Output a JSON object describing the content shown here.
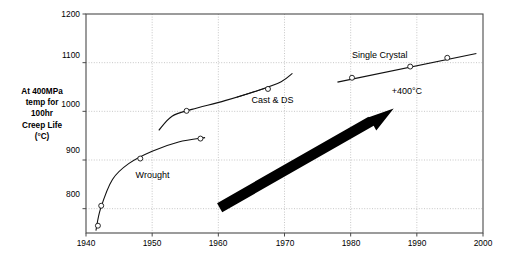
{
  "chart_data": {
    "type": "scatter",
    "title": "",
    "subtitle": "",
    "xlabel": "",
    "ylabel": "At 400MPa\ntemp for\n100hr\nCreep Life\n(°C)",
    "xlim": [
      1940,
      2000
    ],
    "ylim": [
      750,
      1200
    ],
    "xticks": [
      1940,
      1950,
      1960,
      1970,
      1980,
      1990,
      2000
    ],
    "xticklabels": [
      "1940",
      "1950",
      "1960",
      "1970",
      "1980",
      "1990",
      "2000"
    ],
    "yticks": [
      800,
      900,
      1000,
      1100,
      1200
    ],
    "yticklabels": [
      "800",
      "900",
      "1000",
      "1100",
      "1200"
    ],
    "grid": true,
    "legend_position": "inline-annotations",
    "series": [
      {
        "name": "Wrought",
        "label_x": 1947.5,
        "label_y": 868,
        "marker": "open-circle",
        "points": [
          {
            "x": 1941.8,
            "y": 765
          },
          {
            "x": 1942.3,
            "y": 806
          },
          {
            "x": 1948.2,
            "y": 903
          },
          {
            "x": 1957.3,
            "y": 944
          }
        ],
        "curve": [
          {
            "x": 1941.5,
            "y": 755
          },
          {
            "x": 1942.2,
            "y": 800
          },
          {
            "x": 1944.0,
            "y": 860
          },
          {
            "x": 1946.5,
            "y": 893
          },
          {
            "x": 1950.0,
            "y": 918
          },
          {
            "x": 1954.0,
            "y": 937
          },
          {
            "x": 1958.0,
            "y": 946
          }
        ]
      },
      {
        "name": "Cast & DS",
        "label_x": 1965.0,
        "label_y": 1022,
        "marker": "open-circle",
        "points": [
          {
            "x": 1955.2,
            "y": 1001
          },
          {
            "x": 1967.5,
            "y": 1046
          }
        ],
        "curve": [
          {
            "x": 1951.0,
            "y": 961
          },
          {
            "x": 1953.0,
            "y": 990
          },
          {
            "x": 1956.0,
            "y": 1004
          },
          {
            "x": 1961.0,
            "y": 1022
          },
          {
            "x": 1966.0,
            "y": 1043
          },
          {
            "x": 1969.5,
            "y": 1061
          },
          {
            "x": 1971.2,
            "y": 1078
          }
        ],
        "leader": [
          {
            "x": 1962.8,
            "y": 1029
          },
          {
            "x": 1967.0,
            "y": 1047
          }
        ]
      },
      {
        "name": "Single Crystal",
        "label_x": 1980.2,
        "label_y": 1113,
        "marker": "open-circle",
        "points": [
          {
            "x": 1980.2,
            "y": 1069
          },
          {
            "x": 1989.0,
            "y": 1092
          },
          {
            "x": 1994.6,
            "y": 1110
          }
        ],
        "trend": [
          {
            "x": 1978.0,
            "y": 1060
          },
          {
            "x": 1999.0,
            "y": 1119
          }
        ]
      }
    ],
    "annotations": [
      {
        "text": "+400°C",
        "x": 1988.5,
        "y": 1040,
        "kind": "text"
      },
      {
        "text": "",
        "kind": "arrow",
        "x0": 1960.2,
        "y0": 802,
        "x1": 1986.5,
        "y1": 1006
      }
    ]
  },
  "ylabel_lines": {
    "l1": "At 400MPa",
    "l2": "temp for",
    "l3": "100hr",
    "l4": "Creep Life",
    "l5": "(°C)"
  },
  "labels": {
    "y_1200": "1200",
    "y_1100": "1100",
    "y_1000": "1000",
    "y_900": "900",
    "y_800": "800",
    "x_1940": "1940",
    "x_1950": "1950",
    "x_1960": "1960",
    "x_1970": "1970",
    "x_1980": "1980",
    "x_1990": "1990",
    "x_2000": "2000",
    "series_wrought": "Wrought",
    "series_cast_ds": "Cast & DS",
    "series_single_crystal": "Single Crystal",
    "annot_plus400": "+400°C"
  }
}
